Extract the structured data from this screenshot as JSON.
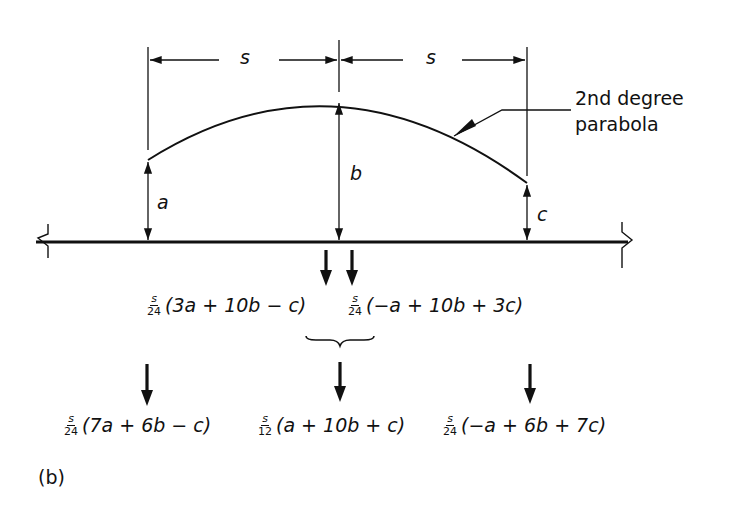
{
  "figure": {
    "panel_label": "(b)",
    "dimensions": {
      "left_span": "s",
      "right_span": "s"
    },
    "curve_label_line1": "2nd degree",
    "curve_label_line2": "parabola",
    "ordinates": {
      "left": "a",
      "middle": "b",
      "right": "c"
    },
    "intermediate_loads": [
      {
        "frac_num": "s",
        "frac_den": "24",
        "expr": "(3a + 10b − c)"
      },
      {
        "frac_num": "s",
        "frac_den": "24",
        "expr": "(−a + 10b + 3c)"
      }
    ],
    "final_loads": [
      {
        "frac_num": "s",
        "frac_den": "24",
        "expr": "(7a + 6b − c)"
      },
      {
        "frac_num": "s",
        "frac_den": "12",
        "expr": "(a + 10b + c)"
      },
      {
        "frac_num": "s",
        "frac_den": "24",
        "expr": "(−a + 6b + 7c)"
      }
    ]
  }
}
